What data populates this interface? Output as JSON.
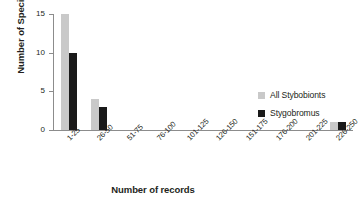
{
  "chart_data": {
    "type": "bar",
    "title": "",
    "xlabel": "Number of records",
    "ylabel": "Number of Species",
    "categories": [
      "1-25",
      "26-50",
      "51-75",
      "76-100",
      "101-125",
      "126-150",
      "151-175",
      "176-200",
      "201-225",
      "226-250"
    ],
    "series": [
      {
        "name": "All Stybobionts",
        "color": "#c9c9c9",
        "values": [
          15,
          4,
          0,
          0,
          0,
          0,
          0,
          0,
          0,
          1
        ]
      },
      {
        "name": "Stygobromus",
        "color": "#1a1a1a",
        "values": [
          10,
          3,
          0,
          0,
          0,
          0,
          0,
          0,
          0,
          1
        ]
      }
    ],
    "ylim": [
      0,
      15
    ],
    "yticks": [
      0,
      5,
      10,
      15
    ],
    "grid": false,
    "legend_position": "right"
  },
  "legend": {
    "items": [
      {
        "label": "All Stybobionts"
      },
      {
        "label": "Stygobromus"
      }
    ]
  },
  "axes": {
    "y_title": "Number of Species",
    "x_title": "Number of records",
    "y_tick_labels": [
      "0",
      "5",
      "10",
      "15"
    ],
    "x_tick_labels": [
      "1-25",
      "26-50",
      "51-75",
      "76-100",
      "101-125",
      "126-150",
      "151-175",
      "176-200",
      "201-225",
      "226-250"
    ]
  }
}
